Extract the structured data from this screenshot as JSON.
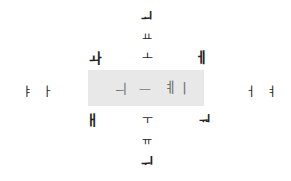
{
  "figure": {
    "type": "scatter-text",
    "background_color": "#ffffff",
    "width": 291,
    "height": 181
  },
  "highlight": {
    "name": "central-highlight-band",
    "color": "#e8e8e8",
    "x": 88,
    "y": 70,
    "width": 116,
    "height": 36
  },
  "chart_data": {
    "type": "scatter",
    "title": "",
    "xlabel": "",
    "ylabel": "",
    "grid": false,
    "legend": null,
    "xlim": [
      0,
      291
    ],
    "ylim": [
      0,
      181
    ],
    "points": [
      {
        "label": "ᅬ",
        "x": 147,
        "y": 17,
        "size": 13,
        "group": "outer",
        "weight": "bold"
      },
      {
        "label": "ㅛ",
        "x": 147,
        "y": 37,
        "size": 11,
        "group": "outer",
        "weight": "normal"
      },
      {
        "label": "ㅗ",
        "x": 147,
        "y": 57,
        "size": 12,
        "group": "outer",
        "weight": "normal"
      },
      {
        "label": "ㅘ",
        "x": 95,
        "y": 58,
        "size": 14,
        "group": "outer",
        "weight": "bold"
      },
      {
        "label": "ㅔ",
        "x": 201,
        "y": 57,
        "size": 14,
        "group": "outer",
        "weight": "bold"
      },
      {
        "label": "ㅑ",
        "x": 27,
        "y": 92,
        "size": 12,
        "group": "outer",
        "weight": "normal"
      },
      {
        "label": "ㅏ",
        "x": 47,
        "y": 92,
        "size": 12,
        "group": "outer",
        "weight": "normal"
      },
      {
        "label": "ㅓ",
        "x": 250,
        "y": 92,
        "size": 12,
        "group": "outer",
        "weight": "normal"
      },
      {
        "label": "ㅕ",
        "x": 271,
        "y": 92,
        "size": 12,
        "group": "outer",
        "weight": "normal"
      },
      {
        "label": "ㅐ",
        "x": 92,
        "y": 120,
        "size": 14,
        "group": "outer",
        "weight": "bold"
      },
      {
        "label": "ㅜ",
        "x": 147,
        "y": 120,
        "size": 12,
        "group": "outer",
        "weight": "normal"
      },
      {
        "label": "ᅯ",
        "x": 205,
        "y": 120,
        "size": 13,
        "group": "outer",
        "weight": "bold"
      },
      {
        "label": "ㅠ",
        "x": 147,
        "y": 141,
        "size": 11,
        "group": "outer",
        "weight": "normal"
      },
      {
        "label": "ᅱ",
        "x": 147,
        "y": 163,
        "size": 14,
        "group": "outer",
        "weight": "bold"
      },
      {
        "label": "ㅢ",
        "x": 121,
        "y": 88,
        "size": 13,
        "group": "inner",
        "weight": "normal"
      },
      {
        "label": "ㅡ",
        "x": 145,
        "y": 89,
        "size": 13,
        "group": "faint",
        "weight": "normal"
      },
      {
        "label": "ㅖ",
        "x": 170,
        "y": 87,
        "size": 14,
        "group": "inner",
        "weight": "normal"
      },
      {
        "label": "ㅣ",
        "x": 184,
        "y": 88,
        "size": 14,
        "group": "inner",
        "weight": "normal"
      }
    ]
  }
}
